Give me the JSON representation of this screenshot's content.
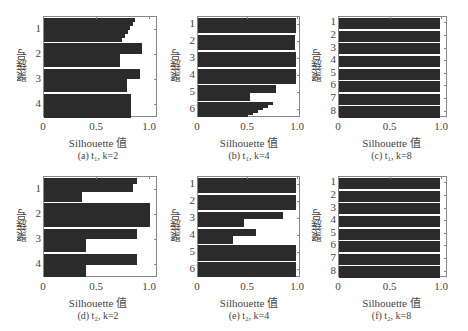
{
  "figure": {
    "ylabel": "聚簇号",
    "xlabel": "Silhouette 值",
    "xticks": [
      "0",
      "0.5",
      "1.0"
    ]
  },
  "chart_data": [
    {
      "type": "bar",
      "orientation": "horizontal",
      "title": "(a) t1, k=2",
      "caption": "(a) t₁, k=2",
      "xlabel": "Silhouette 值",
      "ylabel": "聚簇号",
      "xlim": [
        0,
        1.05
      ],
      "xticks": [
        0,
        0.5,
        1.0
      ],
      "clusters": [
        {
          "id": "1",
          "max": 0.86,
          "min": 0.74,
          "shape": "tapered"
        },
        {
          "id": "2",
          "max": 0.92,
          "min": 0.72,
          "shape": "step"
        },
        {
          "id": "3",
          "max": 0.91,
          "min": 0.78,
          "shape": "step"
        },
        {
          "id": "4",
          "max": 0.82,
          "min": 0.8,
          "shape": "flat"
        }
      ]
    },
    {
      "type": "bar",
      "orientation": "horizontal",
      "title": "(b) t1, k=4",
      "caption": "(b) t₁, k=4",
      "xlabel": "Silhouette 值",
      "ylabel": "聚簇号",
      "xlim": [
        0,
        1.05
      ],
      "xticks": [
        0,
        0.5,
        1.0
      ],
      "clusters": [
        {
          "id": "1",
          "max": 0.98,
          "min": 0.98,
          "shape": "flat"
        },
        {
          "id": "2",
          "max": 0.97,
          "min": 0.97,
          "shape": "flat"
        },
        {
          "id": "3",
          "max": 0.98,
          "min": 0.98,
          "shape": "flat"
        },
        {
          "id": "4",
          "max": 0.98,
          "min": 0.98,
          "shape": "flat"
        },
        {
          "id": "5",
          "max": 0.78,
          "min": 0.52,
          "shape": "step"
        },
        {
          "id": "6",
          "max": 0.75,
          "min": 0.5,
          "shape": "tapered"
        }
      ]
    },
    {
      "type": "bar",
      "orientation": "horizontal",
      "title": "(c) t1, k=8",
      "caption": "(c) t₁, k=8",
      "xlabel": "Silhouette 值",
      "ylabel": "聚簇号",
      "xlim": [
        0,
        1.05
      ],
      "xticks": [
        0,
        0.5,
        1.0
      ],
      "clusters": [
        {
          "id": "1",
          "max": 0.98,
          "min": 0.98,
          "shape": "flat"
        },
        {
          "id": "2",
          "max": 0.98,
          "min": 0.98,
          "shape": "flat"
        },
        {
          "id": "3",
          "max": 0.98,
          "min": 0.98,
          "shape": "flat"
        },
        {
          "id": "4",
          "max": 0.98,
          "min": 0.98,
          "shape": "flat"
        },
        {
          "id": "5",
          "max": 0.98,
          "min": 0.98,
          "shape": "flat"
        },
        {
          "id": "6",
          "max": 0.98,
          "min": 0.98,
          "shape": "flat"
        },
        {
          "id": "7",
          "max": 0.98,
          "min": 0.98,
          "shape": "flat"
        },
        {
          "id": "8",
          "max": 0.98,
          "min": 0.98,
          "shape": "flat"
        }
      ]
    },
    {
      "type": "bar",
      "orientation": "horizontal",
      "title": "(d) t2, k=2",
      "caption": "(d) t₂, k=2",
      "xlabel": "Silhouette 值",
      "ylabel": "聚簇号",
      "xlim": [
        0,
        1.05
      ],
      "xticks": [
        0,
        0.5,
        1.0
      ],
      "clusters": [
        {
          "id": "1",
          "max": 0.88,
          "min": 0.36,
          "shape": "step3",
          "mid": 0.84
        },
        {
          "id": "2",
          "max": 1.0,
          "min": 1.0,
          "shape": "flat"
        },
        {
          "id": "3",
          "max": 0.88,
          "min": 0.4,
          "shape": "step"
        },
        {
          "id": "4",
          "max": 0.88,
          "min": 0.4,
          "shape": "step"
        }
      ]
    },
    {
      "type": "bar",
      "orientation": "horizontal",
      "title": "(e) t2, k=4",
      "caption": "(e) t₂, k=4",
      "xlabel": "Silhouette 值",
      "ylabel": "聚簇号",
      "xlim": [
        0,
        1.05
      ],
      "xticks": [
        0,
        0.5,
        1.0
      ],
      "clusters": [
        {
          "id": "1",
          "max": 0.98,
          "min": 0.98,
          "shape": "flat"
        },
        {
          "id": "2",
          "max": 0.98,
          "min": 0.98,
          "shape": "flat"
        },
        {
          "id": "3",
          "max": 0.85,
          "min": 0.46,
          "shape": "step"
        },
        {
          "id": "4",
          "max": 0.58,
          "min": 0.35,
          "shape": "step"
        },
        {
          "id": "5",
          "max": 0.98,
          "min": 0.98,
          "shape": "flat"
        },
        {
          "id": "6",
          "max": 0.98,
          "min": 0.98,
          "shape": "flat"
        }
      ]
    },
    {
      "type": "bar",
      "orientation": "horizontal",
      "title": "(f) t2, k=8",
      "caption": "(f) t₂, k=8",
      "xlabel": "Silhouette 值",
      "ylabel": "聚簇号",
      "xlim": [
        0,
        1.05
      ],
      "xticks": [
        0,
        0.5,
        1.0
      ],
      "clusters": [
        {
          "id": "1",
          "max": 0.98,
          "min": 0.98,
          "shape": "flat"
        },
        {
          "id": "2",
          "max": 0.98,
          "min": 0.98,
          "shape": "flat"
        },
        {
          "id": "3",
          "max": 0.98,
          "min": 0.98,
          "shape": "flat"
        },
        {
          "id": "4",
          "max": 0.98,
          "min": 0.98,
          "shape": "flat"
        },
        {
          "id": "5",
          "max": 0.98,
          "min": 0.98,
          "shape": "flat"
        },
        {
          "id": "6",
          "max": 0.98,
          "min": 0.98,
          "shape": "flat"
        },
        {
          "id": "7",
          "max": 0.98,
          "min": 0.98,
          "shape": "flat"
        },
        {
          "id": "8",
          "max": 0.98,
          "min": 0.98,
          "shape": "flat"
        }
      ]
    }
  ]
}
